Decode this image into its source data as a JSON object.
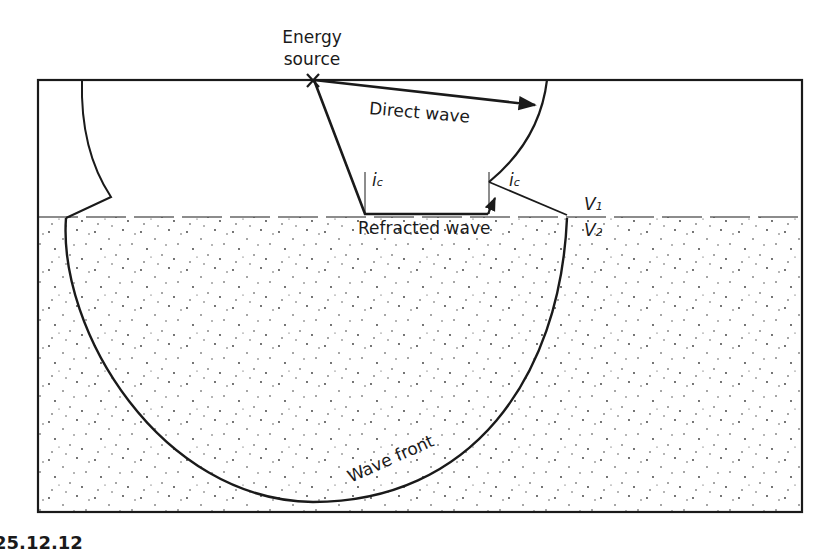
{
  "diagram": {
    "type": "seismic-refraction-cross-section",
    "labels": {
      "energy_source_line1": "Energy",
      "energy_source_line2": "source",
      "direct_wave": "Direct wave",
      "refracted_wave": "Refracted wave",
      "wave_front": "Wave front",
      "critical_angle_left": "i",
      "critical_angle_left_sub": "c",
      "critical_angle_right": "i",
      "critical_angle_right_sub": "c",
      "v1": "V",
      "v1_sub": "1",
      "v2": "V",
      "v2_sub": "2",
      "figure_caption": "25.12.12"
    },
    "layers": [
      {
        "name": "upper layer",
        "velocity": "V1",
        "fill": "blank"
      },
      {
        "name": "lower layer",
        "velocity": "V2",
        "fill": "stippled"
      }
    ],
    "colors": {
      "line": "#1a1a1a",
      "background": "#ffffff",
      "stipple": "#333333"
    }
  }
}
